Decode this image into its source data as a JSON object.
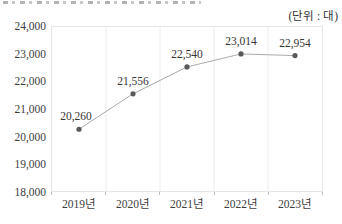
{
  "unit_label": "(단위 : 대)",
  "chart_data": {
    "type": "line",
    "categories": [
      "2019년",
      "2020년",
      "2021년",
      "2022년",
      "2023년"
    ],
    "values": [
      20260,
      21556,
      22540,
      23014,
      22954
    ],
    "value_labels": [
      "20,260",
      "21,556",
      "22,540",
      "23,014",
      "22,954"
    ],
    "y_tick_labels": [
      "24,000",
      "23,000",
      "22,000",
      "21,000",
      "20,000",
      "19,000",
      "18,000"
    ],
    "ylim": [
      18000,
      24000
    ],
    "xlabel": "",
    "ylabel": "",
    "title": "",
    "legend": "none",
    "grid": "vertical-only",
    "colors": {
      "line": "#ababab",
      "marker": "#595959",
      "grid": "#ececec",
      "border": "#e6e6e6",
      "tick": "#bdbdbd",
      "text": "#3d3d3d"
    }
  }
}
